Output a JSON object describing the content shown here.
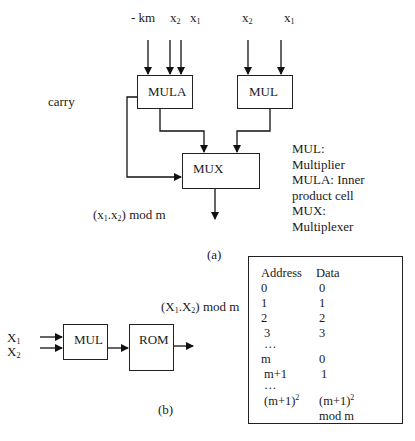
{
  "figure_a": {
    "inputs": {
      "mula": [
        {
          "label": "- km"
        },
        {
          "label": "x",
          "sub": "2"
        },
        {
          "label": "x",
          "sub": "1"
        }
      ],
      "mul": [
        {
          "label": "x",
          "sub": "2"
        },
        {
          "label": "x",
          "sub": "1"
        }
      ]
    },
    "blocks": {
      "mula": "MULA",
      "mul": "MUL",
      "mux": "MUX"
    },
    "carry_label": "carry",
    "output_label": {
      "pre": "(x",
      "s1": "1",
      "mid": ".x",
      "s2": "2",
      "post": ") mod m"
    },
    "legend": [
      "MUL:",
      "Multiplier",
      "MULA: Inner",
      "product cell",
      "MUX:",
      "Multiplexer"
    ],
    "caption": "(a)"
  },
  "figure_b": {
    "inputs": [
      {
        "label": "X",
        "sub": "1"
      },
      {
        "label": "X",
        "sub": "2"
      }
    ],
    "blocks": {
      "mul": "MUL",
      "rom": "ROM"
    },
    "output_label": {
      "pre": "(X",
      "s1": "1",
      "mid": ".X",
      "s2": "2",
      "post": ") mod m"
    },
    "caption": "(b)",
    "rom_table": {
      "headers": {
        "address": "Address",
        "data": "Data"
      },
      "rows": [
        {
          "address": "0",
          "data": "0"
        },
        {
          "address": "1",
          "data": "1"
        },
        {
          "address": "2",
          "data": "2"
        },
        {
          "address": " 3",
          "data": "3"
        },
        {
          "address": " …",
          "data": ""
        },
        {
          "address": "m",
          "data": "0"
        },
        {
          "address": " m+1",
          "data": " 1"
        },
        {
          "address": " …",
          "data": ""
        }
      ],
      "last_row": {
        "address_base": "(m+1)",
        "address_exp": "2",
        "data_base": "(m+1)",
        "data_exp": "2",
        "data_suffix": " mod m"
      }
    }
  }
}
